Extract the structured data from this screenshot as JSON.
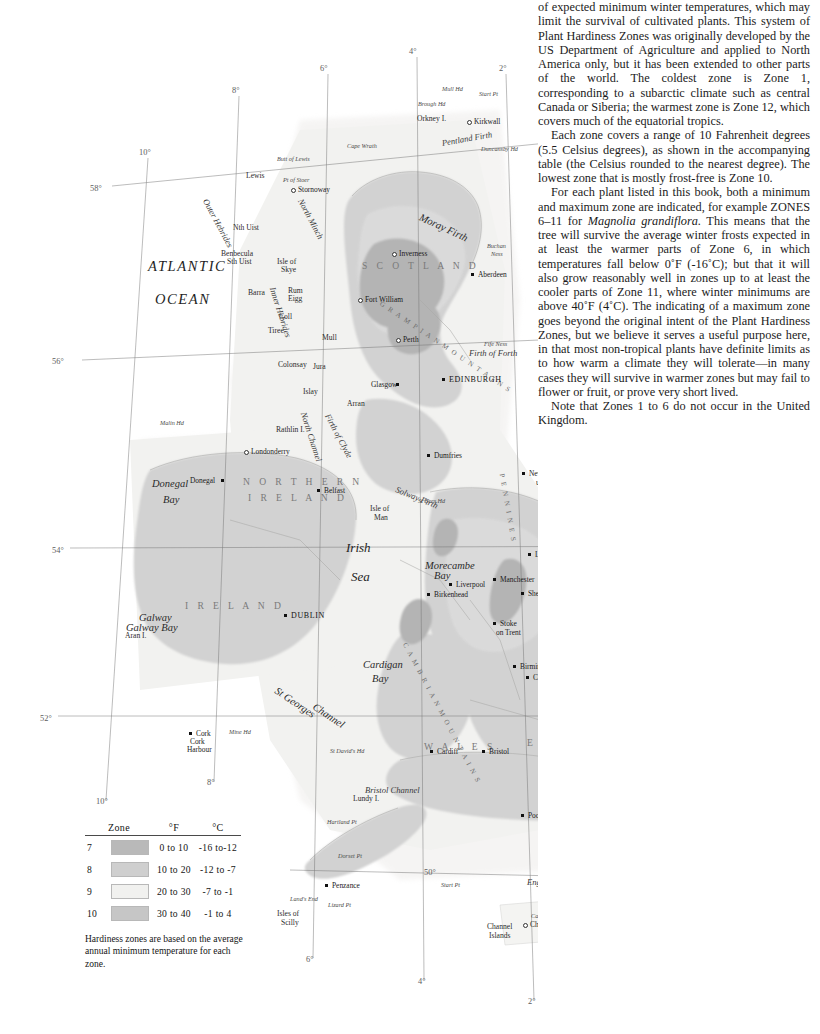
{
  "map": {
    "title": "Plant Hardiness Zones",
    "ocean_labels": [
      {
        "text": "ATLANTIC",
        "x": 148,
        "y": 259
      },
      {
        "text": "OCEAN",
        "x": 155,
        "y": 292
      }
    ],
    "sea_labels": [
      {
        "text": "Irish",
        "x": 346,
        "y": 541
      },
      {
        "text": "Sea",
        "x": 351,
        "y": 570
      }
    ],
    "countries": [
      {
        "text": "S C O T L A N D",
        "x": 362,
        "y": 261
      },
      {
        "text": "I R E L A N D",
        "x": 185,
        "y": 601
      },
      {
        "text": "W A L E S",
        "x": 424,
        "y": 742
      },
      {
        "text": "E N G L A N D",
        "x": 527,
        "y": 738
      },
      {
        "text": "F R A N C E",
        "x": 655,
        "y": 926
      },
      {
        "text": "N O R T H E R N",
        "x": 243,
        "y": 477
      },
      {
        "text": "I R E L A N D",
        "x": 248,
        "y": 493
      }
    ],
    "water_labels": [
      {
        "text": "Pentland  Firth",
        "x": 442,
        "y": 139,
        "rot": -10
      },
      {
        "text": "Moray Firth",
        "x": 420,
        "y": 211,
        "rot": 25
      },
      {
        "text": "Firth of Forth",
        "x": 469,
        "y": 349,
        "rot": 0
      },
      {
        "text": "Firth of Clyde",
        "x": 327,
        "y": 410,
        "rot": 62
      },
      {
        "text": "North Channel",
        "x": 303,
        "y": 408,
        "rot": 72
      },
      {
        "text": "Solway Firth",
        "x": 396,
        "y": 485,
        "rot": 22
      },
      {
        "text": "Morecambe",
        "x": 425,
        "y": 560,
        "rot": 0
      },
      {
        "text": "Bay",
        "x": 434,
        "y": 570,
        "rot": 0
      },
      {
        "text": "Cardigan",
        "x": 363,
        "y": 659,
        "rot": 0
      },
      {
        "text": "Bay",
        "x": 372,
        "y": 673,
        "rot": 0
      },
      {
        "text": "Donegal",
        "x": 152,
        "y": 478,
        "rot": 0
      },
      {
        "text": "Bay",
        "x": 163,
        "y": 494,
        "rot": 0
      },
      {
        "text": "Galway",
        "x": 139,
        "y": 612,
        "rot": 0
      },
      {
        "text": "Galway  Bay",
        "x": 126,
        "y": 622,
        "rot": 0
      },
      {
        "text": "Bristol  Channel",
        "x": 365,
        "y": 786,
        "rot": 0
      },
      {
        "text": "English   Channel",
        "x": 527,
        "y": 878,
        "rot": 0
      },
      {
        "text": "St Georges",
        "x": 276,
        "y": 684,
        "rot": 34
      },
      {
        "text": "Channel",
        "x": 314,
        "y": 700,
        "rot": 34
      },
      {
        "text": "The",
        "x": 631,
        "y": 641,
        "rot": 0
      },
      {
        "text": "Wash",
        "x": 629,
        "y": 652,
        "rot": 0
      },
      {
        "text": "Outer  Hebrides",
        "x": 205,
        "y": 195,
        "rot": 62
      },
      {
        "text": "Inner  Hebrides",
        "x": 272,
        "y": 283,
        "rot": 72
      },
      {
        "text": "North  Minch",
        "x": 300,
        "y": 195,
        "rot": 62
      }
    ],
    "ranges": [
      {
        "text": "G R A M P I A N   M O U N T A I N S",
        "x": 380,
        "y": 300,
        "rot": 34
      },
      {
        "text": "P E N N I N E S",
        "x": 501,
        "y": 470,
        "rot": 80
      },
      {
        "text": "C A M B R I A N   M O U N T A I N S",
        "x": 404,
        "y": 640,
        "rot": 62
      }
    ],
    "cities": [
      {
        "text": "Kirkwall",
        "x": 474,
        "y": 118,
        "dx": -7,
        "dy": 2,
        "style": "city",
        "marker": "hollow"
      },
      {
        "text": "Stornoway",
        "x": 298,
        "y": 186,
        "dx": -7,
        "dy": 2,
        "style": "city",
        "marker": "hollow"
      },
      {
        "text": "Inverness",
        "x": 399,
        "y": 250,
        "dx": -7,
        "dy": 2,
        "style": "city",
        "marker": "hollow"
      },
      {
        "text": "Aberdeen",
        "x": 478,
        "y": 271,
        "dx": -7,
        "dy": 2,
        "style": "city",
        "marker": "dot"
      },
      {
        "text": "Fort William",
        "x": 365,
        "y": 296,
        "dx": -7,
        "dy": 2,
        "style": "city",
        "marker": "hollow"
      },
      {
        "text": "Perth",
        "x": 403,
        "y": 336,
        "dx": -7,
        "dy": 2,
        "style": "city",
        "marker": "hollow"
      },
      {
        "text": "EDINBURGH",
        "x": 449,
        "y": 376,
        "dx": -7,
        "dy": 2,
        "style": "capital",
        "marker": "dot"
      },
      {
        "text": "Glasgow",
        "x": 371,
        "y": 381,
        "dx": 25,
        "dy": 2,
        "style": "city",
        "marker": "dot"
      },
      {
        "text": "Dumfries",
        "x": 434,
        "y": 452,
        "dx": -7,
        "dy": 2,
        "style": "city",
        "marker": "dot"
      },
      {
        "text": "Londonderry",
        "x": 251,
        "y": 448,
        "dx": -7,
        "dy": 2,
        "style": "city",
        "marker": "hollow"
      },
      {
        "text": "Belfast",
        "x": 324,
        "y": 487,
        "dx": -7,
        "dy": 2,
        "style": "city",
        "marker": "dot"
      },
      {
        "text": "Donegal",
        "x": 190,
        "y": 477,
        "dx": 31,
        "dy": 2,
        "style": "city",
        "marker": "dot"
      },
      {
        "text": "DUBLIN",
        "x": 291,
        "y": 612,
        "dx": -7,
        "dy": 2,
        "style": "capital",
        "marker": "dot"
      },
      {
        "text": "Newcastle",
        "x": 529,
        "y": 470,
        "dx": -7,
        "dy": 2,
        "style": "city",
        "marker": "dot"
      },
      {
        "text": "upon Tyne",
        "x": 536,
        "y": 479,
        "dx": -7,
        "dy": 2,
        "style": "city",
        "marker": "none"
      },
      {
        "text": "Leeds",
        "x": 535,
        "y": 551,
        "dx": -7,
        "dy": 2,
        "style": "city",
        "marker": "dot"
      },
      {
        "text": "Hull",
        "x": 581,
        "y": 549,
        "dx": -7,
        "dy": 2,
        "style": "city",
        "marker": "dot"
      },
      {
        "text": "Manchester",
        "x": 500,
        "y": 576,
        "dx": -7,
        "dy": 2,
        "style": "city",
        "marker": "dot"
      },
      {
        "text": "Liverpool",
        "x": 456,
        "y": 581,
        "dx": -7,
        "dy": 2,
        "style": "city",
        "marker": "dot"
      },
      {
        "text": "Birkenhead",
        "x": 434,
        "y": 591,
        "dx": -7,
        "dy": 2,
        "style": "city",
        "marker": "dot"
      },
      {
        "text": "Sheffield",
        "x": 528,
        "y": 590,
        "dx": -7,
        "dy": 2,
        "style": "city",
        "marker": "dot"
      },
      {
        "text": "Stoke",
        "x": 500,
        "y": 620,
        "dx": -7,
        "dy": 2,
        "style": "city",
        "marker": "dot"
      },
      {
        "text": "on Trent",
        "x": 496,
        "y": 629,
        "dx": -7,
        "dy": 2,
        "style": "city",
        "marker": "none"
      },
      {
        "text": "Nottingham",
        "x": 560,
        "y": 622,
        "dx": -7,
        "dy": 2,
        "style": "city",
        "marker": "dot"
      },
      {
        "text": "Leicester",
        "x": 551,
        "y": 644,
        "dx": -7,
        "dy": 2,
        "style": "city",
        "marker": "dot"
      },
      {
        "text": "Birmingham",
        "x": 520,
        "y": 663,
        "dx": -7,
        "dy": 2,
        "style": "city",
        "marker": "dot"
      },
      {
        "text": "Coventry",
        "x": 533,
        "y": 674,
        "dx": -7,
        "dy": 2,
        "style": "city",
        "marker": "dot"
      },
      {
        "text": "LONDON",
        "x": 594,
        "y": 757,
        "dx": -7,
        "dy": 2,
        "style": "capital",
        "marker": "dot"
      },
      {
        "text": "Cardiff",
        "x": 437,
        "y": 748,
        "dx": -7,
        "dy": 2,
        "style": "city",
        "marker": "dot"
      },
      {
        "text": "Bristol",
        "x": 489,
        "y": 748,
        "dx": -7,
        "dy": 2,
        "style": "city",
        "marker": "dot"
      },
      {
        "text": "Poole",
        "x": 528,
        "y": 812,
        "dx": -7,
        "dy": 2,
        "style": "city",
        "marker": "dot"
      },
      {
        "text": "Brighton",
        "x": 611,
        "y": 797,
        "dx": -7,
        "dy": 2,
        "style": "city",
        "marker": "dot"
      },
      {
        "text": "Penzance",
        "x": 332,
        "y": 882,
        "dx": -7,
        "dy": 2,
        "style": "city",
        "marker": "dot"
      },
      {
        "text": "Cork",
        "x": 196,
        "y": 730,
        "dx": -7,
        "dy": 2,
        "style": "city",
        "marker": "dot"
      },
      {
        "text": "Cork",
        "x": 190,
        "y": 738,
        "dx": -7,
        "dy": 2,
        "style": "city",
        "marker": "none"
      },
      {
        "text": "Harbour",
        "x": 187,
        "y": 746,
        "dx": -7,
        "dy": 2,
        "style": "city",
        "marker": "none"
      },
      {
        "text": "Calais",
        "x": 706,
        "y": 800,
        "dx": -7,
        "dy": 2,
        "style": "city",
        "marker": "dot"
      },
      {
        "text": "Boulogne",
        "x": 700,
        "y": 812,
        "dx": -7,
        "dy": 2,
        "style": "city",
        "marker": "dot"
      },
      {
        "text": "Dieppe",
        "x": 703,
        "y": 892,
        "dx": -7,
        "dy": 2,
        "style": "city",
        "marker": "hollow"
      },
      {
        "text": "Fecamp",
        "x": 661,
        "y": 905,
        "dx": -7,
        "dy": 2,
        "style": "city",
        "marker": "hollow"
      },
      {
        "text": "Le Havre",
        "x": 624,
        "y": 929,
        "dx": -7,
        "dy": 2,
        "style": "city",
        "marker": "hollow"
      },
      {
        "text": "Cherbourg",
        "x": 530,
        "y": 921,
        "dx": -7,
        "dy": 2,
        "style": "city",
        "marker": "hollow"
      }
    ],
    "islands": [
      {
        "text": "Orkney I.",
        "x": 417,
        "y": 115
      },
      {
        "text": "Lewis",
        "x": 246,
        "y": 172
      },
      {
        "text": "Nth Uist",
        "x": 233,
        "y": 224
      },
      {
        "text": "Benbecula",
        "x": 221,
        "y": 250
      },
      {
        "text": "Sth Uist",
        "x": 227,
        "y": 258
      },
      {
        "text": "Isle of",
        "x": 277,
        "y": 258
      },
      {
        "text": "Skye",
        "x": 281,
        "y": 266
      },
      {
        "text": "Barra",
        "x": 248,
        "y": 289
      },
      {
        "text": "Rum",
        "x": 288,
        "y": 287
      },
      {
        "text": "Eigg",
        "x": 288,
        "y": 295
      },
      {
        "text": "Coll",
        "x": 279,
        "y": 313
      },
      {
        "text": "Tiree",
        "x": 268,
        "y": 327
      },
      {
        "text": "Mull",
        "x": 322,
        "y": 334
      },
      {
        "text": "Colonsay",
        "x": 278,
        "y": 361
      },
      {
        "text": "Jura",
        "x": 313,
        "y": 363
      },
      {
        "text": "Islay",
        "x": 303,
        "y": 388
      },
      {
        "text": "Arran",
        "x": 347,
        "y": 400
      },
      {
        "text": "Rathlin I.",
        "x": 276,
        "y": 426
      },
      {
        "text": "Isle of",
        "x": 370,
        "y": 505
      },
      {
        "text": "Man",
        "x": 374,
        "y": 514
      },
      {
        "text": "Aran I.",
        "x": 125,
        "y": 632
      },
      {
        "text": "Lundy I.",
        "x": 353,
        "y": 795
      },
      {
        "text": "Isle of",
        "x": 564,
        "y": 817
      },
      {
        "text": "Wight",
        "x": 566,
        "y": 826
      },
      {
        "text": "Isles of",
        "x": 277,
        "y": 910
      },
      {
        "text": "Scilly",
        "x": 281,
        "y": 919
      },
      {
        "text": "Channel",
        "x": 487,
        "y": 923
      },
      {
        "text": "Islands",
        "x": 489,
        "y": 932
      }
    ],
    "points": [
      {
        "text": "Mull Hd",
        "x": 442,
        "y": 86
      },
      {
        "text": "Start Pt",
        "x": 479,
        "y": 91
      },
      {
        "text": "Brough Hd",
        "x": 418,
        "y": 101
      },
      {
        "text": "Duncansby Hd",
        "x": 481,
        "y": 146
      },
      {
        "text": "Cape Wrath",
        "x": 347,
        "y": 143
      },
      {
        "text": "Butt of Lewis",
        "x": 277,
        "y": 156
      },
      {
        "text": "Pt of Stoer",
        "x": 283,
        "y": 177
      },
      {
        "text": "Buchan",
        "x": 487,
        "y": 243
      },
      {
        "text": "Ness",
        "x": 491,
        "y": 251
      },
      {
        "text": "Fife Ness",
        "x": 484,
        "y": 341
      },
      {
        "text": "Malin Hd",
        "x": 160,
        "y": 420
      },
      {
        "text": "St Bees Hd",
        "x": 418,
        "y": 498
      },
      {
        "text": "Flamborough Hd",
        "x": 602,
        "y": 538
      },
      {
        "text": "Spurn Hd",
        "x": 625,
        "y": 558
      },
      {
        "text": "The Naze",
        "x": 665,
        "y": 722
      },
      {
        "text": "Mine Hd",
        "x": 229,
        "y": 729
      },
      {
        "text": "St David's Hd",
        "x": 330,
        "y": 748
      },
      {
        "text": "Hartland Pt",
        "x": 327,
        "y": 819
      },
      {
        "text": "Beachy Hd",
        "x": 658,
        "y": 809
      },
      {
        "text": "Dorset Pt",
        "x": 338,
        "y": 853
      },
      {
        "text": "Start Pt",
        "x": 441,
        "y": 882
      },
      {
        "text": "Land's End",
        "x": 290,
        "y": 896
      },
      {
        "text": "Lizard Pt",
        "x": 328,
        "y": 902
      },
      {
        "text": "Cabla Hagat",
        "x": 531,
        "y": 913
      }
    ],
    "degree_labels": [
      {
        "text": "8°",
        "x": 232,
        "y": 86
      },
      {
        "text": "6°",
        "x": 320,
        "y": 64
      },
      {
        "text": "4°",
        "x": 409,
        "y": 47
      },
      {
        "text": "2°",
        "x": 499,
        "y": 64
      },
      {
        "text": "10°",
        "x": 139,
        "y": 148
      },
      {
        "text": "58°",
        "x": 90,
        "y": 184
      },
      {
        "text": "56°",
        "x": 52,
        "y": 357
      },
      {
        "text": "54°",
        "x": 52,
        "y": 546
      },
      {
        "text": "54°",
        "x": 742,
        "y": 546
      },
      {
        "text": "52°",
        "x": 40,
        "y": 714
      },
      {
        "text": "52°",
        "x": 750,
        "y": 714
      },
      {
        "text": "50°",
        "x": 424,
        "y": 868
      },
      {
        "text": "50°",
        "x": 742,
        "y": 878
      },
      {
        "text": "10°",
        "x": 96,
        "y": 797
      },
      {
        "text": "8°",
        "x": 207,
        "y": 778
      },
      {
        "text": "6°",
        "x": 306,
        "y": 955
      },
      {
        "text": "4°",
        "x": 418,
        "y": 977
      },
      {
        "text": "2°",
        "x": 528,
        "y": 997
      },
      {
        "text": "0°",
        "x": 643,
        "y": 976
      },
      {
        "text": "2°",
        "x": 748,
        "y": 952
      }
    ]
  },
  "legend": {
    "headers": {
      "zone": "Zone",
      "swatch": "",
      "f": "°F",
      "c": "°C"
    },
    "rows": [
      {
        "zone": "7",
        "color": "#b9b9b9",
        "f": "0  to  10",
        "c": "-16  to-12"
      },
      {
        "zone": "8",
        "color": "#cfcfcf",
        "f": "10  to  20",
        "c": "-12  to  -7"
      },
      {
        "zone": "9",
        "color": "#f1f1ef",
        "f": "20  to  30",
        "c": "-7  to  -1"
      },
      {
        "zone": "10",
        "color": "#c6c6c6",
        "f": "30  to  40",
        "c": "-1  to   4"
      }
    ],
    "note": "Hardiness zones are based on the average annual minimum temperature for each zone."
  },
  "text_column": {
    "paragraphs": [
      {
        "indent": false,
        "runs": [
          {
            "text": "of expected minimum winter temperatures, which may limit the survival of cultivated plants. This system of Plant Hardiness Zones was originally developed by the US Department of Agriculture and applied to North America only, but it has been extended to other parts of the world. The coldest zone is Zone 1, corresponding to a subarctic climate such as central Canada or Siberia; the warmest zone is Zone 12, which covers much of the equatorial tropics.",
            "italic": false
          }
        ]
      },
      {
        "indent": true,
        "runs": [
          {
            "text": "Each zone covers a range of 10 Fahrenheit degrees (5.5 Celsius degrees), as shown in the accompanying table (the Celsius rounded to the nearest degree). The lowest zone that is mostly frost-free is Zone 10.",
            "italic": false
          }
        ]
      },
      {
        "indent": true,
        "runs": [
          {
            "text": "For each plant listed in this book, both a minimum and maximum zone are indicated, for example ZONES 6–11 for ",
            "italic": false
          },
          {
            "text": "Magnolia grandiflora.",
            "italic": true
          },
          {
            "text": " This means that the tree will survive the average winter frosts expected in at least the warmer parts of Zone 6, in which temperatures fall below 0˚F (-16˚C); but that it will also grow reasonably well in zones up to at least the cooler parts of Zone 11, where winter minimums are above 40˚F (4˚C). The indicating of a maximum zone goes beyond the original intent of the Plant Hardiness Zones, but we believe it serves a useful purpose here, in that most non-tropical plants have definite limits as to how warm a climate they will tolerate—in many cases they will survive in warmer zones but may fail to flower or fruit, or prove very short lived.",
            "italic": false
          }
        ]
      },
      {
        "indent": true,
        "runs": [
          {
            "text": "Note that Zones 1 to 6 do not occur in the United Kingdom.",
            "italic": false
          }
        ]
      }
    ]
  }
}
